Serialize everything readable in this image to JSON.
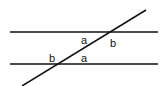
{
  "diagram": {
    "type": "parallel-lines-transversal",
    "stroke_color": "#111111",
    "background": "#ffffff",
    "lines": {
      "top_parallel": {
        "x1": 10,
        "y1": 32,
        "x2": 158,
        "y2": 32
      },
      "bottom_parallel": {
        "x1": 10,
        "y1": 64,
        "x2": 158,
        "y2": 64
      },
      "transversal": {
        "x1": 22,
        "y1": 86,
        "x2": 146,
        "y2": 10
      }
    },
    "labels": [
      {
        "id": "top-a",
        "text": "a",
        "x": 81,
        "y": 44
      },
      {
        "id": "top-b",
        "text": "b",
        "x": 110,
        "y": 47
      },
      {
        "id": "bottom-b",
        "text": "b",
        "x": 49,
        "y": 62
      },
      {
        "id": "bottom-a",
        "text": "a",
        "x": 81,
        "y": 62
      }
    ]
  }
}
